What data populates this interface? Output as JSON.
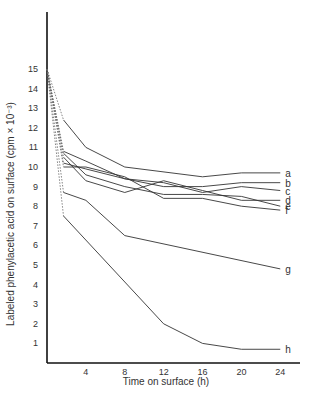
{
  "chart_data": {
    "type": "line",
    "title": "",
    "xlabel": "Time on surface (h)",
    "ylabel": "Labeled phenylacetic acid on surface (cpm × 10⁻³)",
    "xlim": [
      0,
      25
    ],
    "ylim": [
      0,
      18
    ],
    "xticks": [
      4,
      8,
      12,
      16,
      20,
      24
    ],
    "yticks": [
      1,
      2,
      3,
      4,
      5,
      6,
      7,
      8,
      9,
      10,
      11,
      12,
      13,
      14,
      15
    ],
    "grid": false,
    "legend": "inline labels at line ends",
    "note": "Dotted segments from 15 at t=0 to first measurement",
    "series": [
      {
        "name": "a",
        "x": [
          0,
          1.7,
          4,
          8,
          16,
          20,
          24
        ],
        "y": [
          15,
          12.4,
          11.0,
          10.0,
          9.5,
          9.7,
          9.7
        ]
      },
      {
        "name": "b",
        "x": [
          0,
          1.7,
          4,
          8,
          12,
          16,
          20,
          24
        ],
        "y": [
          15,
          10.8,
          10.3,
          9.4,
          9.0,
          9.0,
          9.2,
          9.2
        ]
      },
      {
        "name": "c",
        "x": [
          0,
          1.7,
          4,
          8,
          12,
          16,
          20,
          24
        ],
        "y": [
          15,
          10.2,
          9.9,
          9.4,
          9.2,
          8.7,
          9.0,
          8.8
        ]
      },
      {
        "name": "d",
        "x": [
          0,
          1.7,
          4,
          8,
          12,
          16,
          20,
          24
        ],
        "y": [
          15,
          10.5,
          9.3,
          8.7,
          9.3,
          8.8,
          8.3,
          8.3
        ]
      },
      {
        "name": "e",
        "x": [
          0,
          1.7,
          4,
          8,
          12,
          16,
          20,
          24
        ],
        "y": [
          15,
          10.7,
          9.6,
          9.0,
          8.6,
          8.6,
          8.5,
          8.0
        ]
      },
      {
        "name": "f",
        "x": [
          0,
          1.7,
          4,
          8,
          12,
          16,
          20,
          24
        ],
        "y": [
          15,
          10.0,
          10.0,
          9.5,
          8.4,
          8.4,
          8.0,
          7.8
        ]
      },
      {
        "name": "g",
        "x": [
          0,
          1.7,
          4,
          8,
          24
        ],
        "y": [
          15,
          8.7,
          8.3,
          6.5,
          4.8
        ]
      },
      {
        "name": "h",
        "x": [
          0,
          1.7,
          12,
          16,
          20,
          24
        ],
        "y": [
          15,
          7.5,
          2.0,
          1.0,
          0.7,
          0.7
        ]
      }
    ]
  }
}
